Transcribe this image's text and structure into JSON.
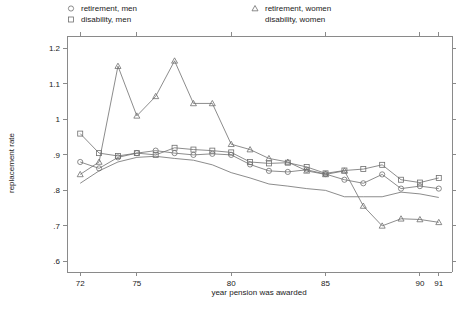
{
  "chart_data": {
    "type": "line",
    "title": "",
    "xlabel": "year pension was awarded",
    "ylabel": "replacement rate",
    "xlim": [
      71.3,
      91.7
    ],
    "ylim": [
      0.57,
      1.235
    ],
    "grid": false,
    "legend_position": "top",
    "x_ticks": [
      72,
      75,
      80,
      85,
      90,
      91
    ],
    "x_tick_labels": [
      "72",
      "75",
      "80",
      "85",
      "90",
      "91"
    ],
    "y_ticks": [
      0.6,
      0.7,
      0.8,
      0.9,
      1.0,
      1.1,
      1.2
    ],
    "y_tick_labels": [
      ".6",
      ".7",
      ".8",
      ".9",
      "1",
      "1.1",
      "1.2"
    ],
    "x": [
      72,
      73,
      74,
      75,
      76,
      77,
      78,
      79,
      80,
      81,
      82,
      83,
      84,
      85,
      86,
      87,
      88,
      89,
      90,
      91
    ],
    "series": [
      {
        "name": "retirement, men",
        "marker": "circle",
        "values": [
          0.88,
          0.862,
          0.893,
          0.905,
          0.912,
          0.905,
          0.9,
          0.903,
          0.9,
          0.873,
          0.855,
          0.852,
          0.858,
          0.846,
          0.83,
          0.82,
          0.845,
          0.805,
          0.812,
          0.805
        ]
      },
      {
        "name": "disability, men",
        "marker": "square",
        "values": [
          0.96,
          0.905,
          0.897,
          0.905,
          0.9,
          0.92,
          0.915,
          0.912,
          0.907,
          0.88,
          0.876,
          0.878,
          0.866,
          0.848,
          0.856,
          0.86,
          0.872,
          0.83,
          0.822,
          0.835
        ]
      },
      {
        "name": "retirement, women",
        "marker": "triangle",
        "values": [
          0.845,
          0.88,
          1.15,
          1.01,
          1.065,
          1.165,
          1.045,
          1.045,
          0.93,
          0.915,
          0.89,
          0.88,
          0.855,
          0.845,
          0.855,
          0.756,
          0.7,
          0.72,
          0.718,
          0.71
        ]
      },
      {
        "name": "disability, women",
        "marker": "none",
        "values": [
          0.82,
          0.855,
          0.88,
          0.893,
          0.896,
          0.89,
          0.885,
          0.872,
          0.85,
          0.835,
          0.818,
          0.812,
          0.805,
          0.8,
          0.782,
          0.782,
          0.782,
          0.795,
          0.79,
          0.78
        ]
      }
    ]
  },
  "legend": {
    "items": [
      {
        "label": "retirement, men",
        "marker": "circle",
        "column": "left"
      },
      {
        "label": "disability, men",
        "marker": "square",
        "column": "left"
      },
      {
        "label": "retirement, women",
        "marker": "triangle",
        "column": "right"
      },
      {
        "label": "disability, women",
        "marker": "none",
        "column": "right"
      }
    ]
  },
  "colors": {
    "line": "#6e6e6e",
    "axis": "#8a8a8a",
    "text": "#1a1a1a",
    "background": "#ffffff"
  }
}
